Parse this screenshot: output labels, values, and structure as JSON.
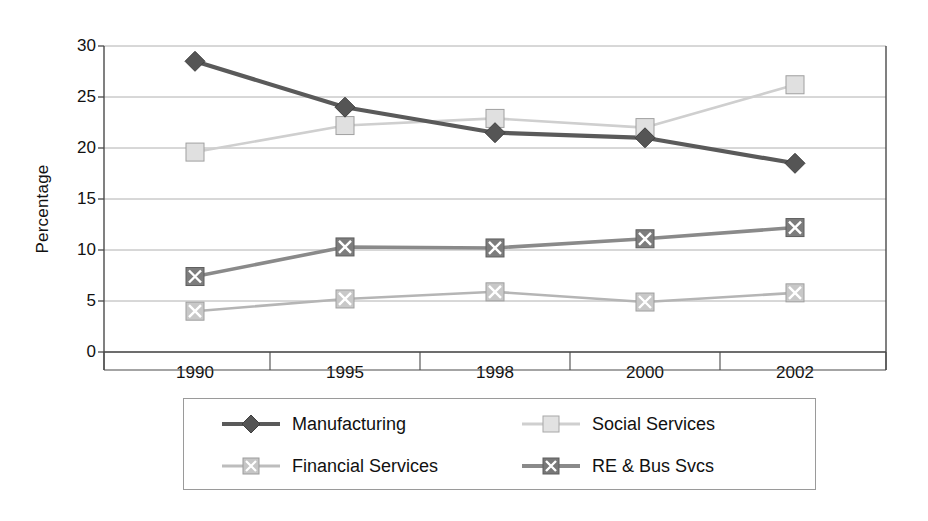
{
  "chart_data": {
    "type": "line",
    "title": "",
    "xlabel": "",
    "ylabel": "Percentage",
    "categories": [
      "1990",
      "1995",
      "1998",
      "2000",
      "2002"
    ],
    "ylim": [
      0,
      30
    ],
    "yticks": [
      0,
      5,
      10,
      15,
      20,
      25,
      30
    ],
    "grid": true,
    "legend_position": "bottom",
    "series": [
      {
        "name": "Manufacturing",
        "values": [
          28.5,
          24.0,
          21.5,
          21.0,
          18.5
        ],
        "color": "#5a5a5a",
        "marker": "diamond",
        "marker_fill": "#555555"
      },
      {
        "name": "Social Services",
        "values": [
          19.6,
          22.2,
          22.9,
          22.0,
          26.2
        ],
        "color": "#cfcfcf",
        "marker": "square",
        "marker_fill": "#e0e0e0"
      },
      {
        "name": "Financial Services",
        "values": [
          4.0,
          5.2,
          5.9,
          4.9,
          5.8
        ],
        "color": "#b5b5b5",
        "marker": "square-x",
        "marker_fill": "#c8c8c8"
      },
      {
        "name": "RE & Bus Svcs",
        "values": [
          7.4,
          10.3,
          10.2,
          11.1,
          12.2
        ],
        "color": "#8a8a8a",
        "marker": "square-x",
        "marker_fill": "#7d7d7d"
      }
    ]
  },
  "axis": {
    "y_title": "Percentage",
    "y_tick_labels": [
      "30",
      "25",
      "20",
      "15",
      "10",
      "5",
      "0"
    ],
    "x_tick_labels": [
      "1990",
      "1995",
      "1998",
      "2000",
      "2002"
    ]
  },
  "legend": {
    "entries": [
      {
        "label": "Manufacturing"
      },
      {
        "label": "Social Services"
      },
      {
        "label": "Financial Services"
      },
      {
        "label": "RE & Bus Svcs"
      }
    ]
  },
  "colors": {
    "axis": "#4a4a4a",
    "grid": "#b0b0b0",
    "text": "#111111",
    "legend_border": "#9a9a9a"
  }
}
